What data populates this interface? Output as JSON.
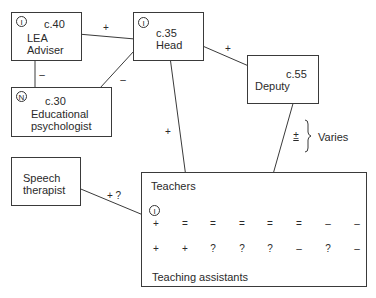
{
  "nodes": {
    "lea": {
      "badge": "I",
      "age": "c.40",
      "line1": "LEA",
      "line2": "Adviser"
    },
    "head": {
      "badge": "I",
      "age": "c.35",
      "line1": "Head"
    },
    "deputy": {
      "age": "c.55",
      "line1": "Deputy"
    },
    "edpsych": {
      "badge": "N",
      "age": "c.30",
      "line1": "Educational",
      "line2": "psychologist"
    },
    "speech": {
      "line1": "Speech",
      "line2": "therapist"
    },
    "teachers": {
      "label": "Teachers",
      "badge": "I"
    },
    "ta": {
      "label": "Teaching assistants"
    }
  },
  "edges": {
    "lea_head": "+",
    "lea_edpsych": "–",
    "edpsych_head": "–",
    "head_deputy": "+",
    "head_teachers": "+",
    "deputy_teachers": "±",
    "speech_teachers": "+ ?"
  },
  "legend": {
    "varies": "Varies"
  },
  "teacher_ratings": [
    "+",
    "=",
    "=",
    "=",
    "=",
    "=",
    "–",
    "–"
  ],
  "ta_ratings": [
    "+",
    "+",
    "?",
    "?",
    "?",
    "–",
    "?",
    "–"
  ]
}
